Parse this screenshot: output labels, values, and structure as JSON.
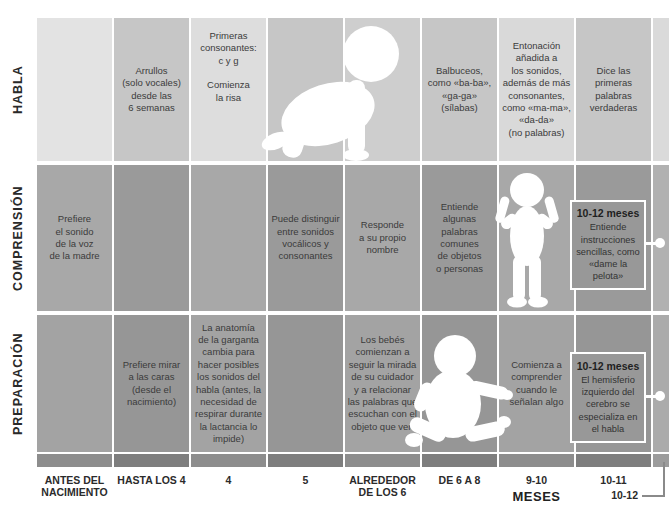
{
  "figure": {
    "rows": [
      {
        "label": "HABLA",
        "cells": [
          "",
          "Arrullos\n(solo vocales)\ndesde las\n6 semanas",
          "Primeras\nconsonantes:\nc y g\n\nComienza\nla risa",
          "",
          "",
          "Balbuceos,\ncomo «ba-ba»,\n«ga-ga»\n(sílabas)",
          "Entonación\nañadida a\nlos sonidos,\nademás de más\nconsonantes,\ncomo «ma-ma»,\n«da-da»\n(no palabras)",
          "Dice las\nprimeras\npalabras\nverdaderas",
          ""
        ]
      },
      {
        "label": "COMPRENSIÓN",
        "cells": [
          "Prefiere\nel sonido\nde la voz\nde la madre",
          "",
          "",
          "Puede distinguir\nentre sonidos\nvocálicos y\nconsonantes",
          "Responde\na su propio\nnombre",
          "Entiende\nalgunas\npalabras\ncomunes\nde objetos\no personas",
          "",
          "",
          ""
        ],
        "callout": {
          "title": "10-12 meses",
          "body": "Entiende\ninstrucciones\nsencillas, como\n«dame la pelota»"
        }
      },
      {
        "label": "PREPARACIÓN",
        "cells": [
          "",
          "Prefiere mirar\na las caras\n(desde el\nnacimiento)",
          "La anatomía\nde la garganta\ncambia para\nhacer posibles\nlos sonidos del\nhabla (antes, la\nnecesidad de\nrespirar durante\nla lactancia lo\nimpide)",
          "",
          "Los bebés\ncomienzan a\nseguir la mirada\nde su cuidador\ny a relacionar\nlas palabras que\nescuchan con el\nobjeto que ven",
          "",
          "Comienza a\ncomprender\ncuando le\nseñalan algo",
          "",
          ""
        ],
        "callout": {
          "title": "10-12 meses",
          "body": "El hemisferio\nizquierdo del\ncerebro se\nespecializa en\nel habla"
        }
      }
    ],
    "axis": {
      "labels": [
        "ANTES DEL\nNACIMIENTO",
        "HASTA LOS 4",
        "4",
        "5",
        "ALREDEDOR\nDE LOS 6",
        "DE 6 A 8",
        "9-10",
        "10-11"
      ],
      "unit": "MESES",
      "extra_label": "10-12"
    },
    "icons": [
      "crawling-baby-silhouette",
      "standing-baby-silhouette",
      "sitting-baby-silhouette"
    ],
    "colors": {
      "row1_light": "#dddddd",
      "row1_dark": "#c6c6c6",
      "row2_light": "#a8a8a8",
      "row2_dark": "#9a9a9a",
      "row3_light": "#a3a3a3",
      "row3_dark": "#969696",
      "bottom_bar_light": "#8d8d8d",
      "bottom_bar_dark": "#7e7e7e",
      "callout_border": "#ffffff",
      "silhouette": "#ffffff",
      "text": "#3b3b3b"
    }
  }
}
